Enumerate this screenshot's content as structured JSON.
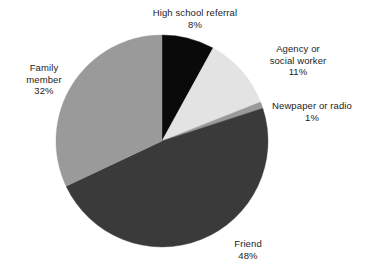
{
  "chart_data": {
    "type": "pie",
    "title": "",
    "subtitle": "",
    "xlabel": "",
    "ylabel": "",
    "legend_position": "none",
    "grid": false,
    "labels_outside": true,
    "start_angle_deg": 0,
    "direction": "clockwise",
    "categories": [
      "High school referral",
      "Agency or social worker",
      "Newpaper or radio",
      "Friend",
      "Family member"
    ],
    "values": [
      8,
      11,
      1,
      48,
      32
    ],
    "value_suffix": "%",
    "total": 100,
    "slices": [
      {
        "label": "High school referral",
        "label_lines": [
          "High school referral"
        ],
        "value": 8,
        "value_text": "8%",
        "color": "#0a0a0a",
        "start_deg": 0,
        "end_deg": 28.8
      },
      {
        "label": "Agency or social worker",
        "label_lines": [
          "Agency or",
          "social worker"
        ],
        "value": 11,
        "value_text": "11%",
        "color": "#e3e3e3",
        "start_deg": 28.8,
        "end_deg": 68.4
      },
      {
        "label": "Newpaper or radio",
        "label_lines": [
          "Newpaper or radio"
        ],
        "value": 1,
        "value_text": "1%",
        "color": "#9a9a9a",
        "start_deg": 68.4,
        "end_deg": 72.0
      },
      {
        "label": "Friend",
        "label_lines": [
          "Friend"
        ],
        "value": 48,
        "value_text": "48%",
        "color": "#3a3a3a",
        "start_deg": 72.0,
        "end_deg": 244.8
      },
      {
        "label": "Family member",
        "label_lines": [
          "Family",
          "member"
        ],
        "value": 32,
        "value_text": "32%",
        "color": "#9a9a9a",
        "start_deg": 244.8,
        "end_deg": 360.0
      }
    ],
    "colors": {
      "background": "#ffffff",
      "text": "#1c1c1c",
      "high_school_referral": "#0a0a0a",
      "agency_or_social_worker": "#e3e3e3",
      "newpaper_or_radio": "#9a9a9a",
      "friend": "#3a3a3a",
      "family_member": "#9a9a9a"
    },
    "geometry": {
      "center_x": 162,
      "center_y": 141,
      "radius": 106
    }
  },
  "labels": {
    "high_school": {
      "line1": "High school referral",
      "value": "8%"
    },
    "agency": {
      "line1": "Agency or",
      "line2": "social worker",
      "value": "11%"
    },
    "newspaper": {
      "line1": "Newpaper or radio",
      "value": "1%"
    },
    "friend": {
      "line1": "Friend",
      "value": "48%"
    },
    "family": {
      "line1": "Family",
      "line2": "member",
      "value": "32%"
    }
  }
}
